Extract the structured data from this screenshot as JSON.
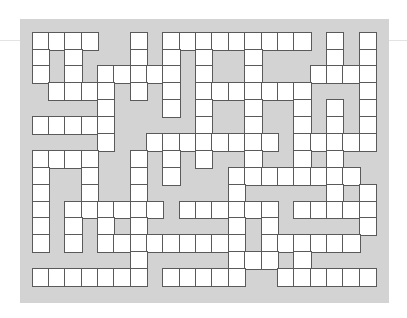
{
  "puzzle": {
    "type": "crossword-grid",
    "columns": 21,
    "rows": 15,
    "colors": {
      "background": "#ffffff",
      "frame": "#d3d3d3",
      "white_cell": "#ffffff",
      "grid_line": "#5a5a5a"
    },
    "grid": [
      [
        1,
        1,
        1,
        1,
        0,
        0,
        1,
        0,
        1,
        1,
        1,
        1,
        1,
        1,
        1,
        1,
        1,
        0,
        1,
        0,
        1
      ],
      [
        1,
        0,
        1,
        0,
        0,
        0,
        1,
        0,
        1,
        0,
        1,
        0,
        0,
        1,
        0,
        0,
        0,
        0,
        1,
        0,
        1
      ],
      [
        1,
        0,
        1,
        0,
        1,
        1,
        1,
        1,
        1,
        0,
        1,
        0,
        0,
        1,
        0,
        0,
        0,
        1,
        1,
        1,
        1
      ],
      [
        0,
        1,
        1,
        1,
        1,
        0,
        1,
        0,
        1,
        0,
        1,
        1,
        1,
        1,
        1,
        1,
        1,
        0,
        0,
        0,
        1
      ],
      [
        0,
        0,
        0,
        0,
        1,
        0,
        0,
        0,
        1,
        0,
        1,
        0,
        0,
        1,
        0,
        0,
        1,
        0,
        1,
        0,
        1
      ],
      [
        1,
        1,
        1,
        1,
        1,
        0,
        0,
        0,
        0,
        0,
        1,
        0,
        0,
        1,
        0,
        0,
        1,
        0,
        1,
        0,
        1
      ],
      [
        0,
        0,
        0,
        0,
        1,
        0,
        0,
        1,
        1,
        1,
        1,
        1,
        1,
        1,
        1,
        0,
        1,
        1,
        1,
        1,
        1
      ],
      [
        1,
        1,
        1,
        1,
        0,
        0,
        1,
        0,
        1,
        0,
        1,
        0,
        0,
        1,
        0,
        0,
        1,
        0,
        1,
        0,
        0
      ],
      [
        1,
        0,
        0,
        1,
        0,
        0,
        1,
        0,
        1,
        0,
        0,
        0,
        1,
        1,
        1,
        1,
        1,
        1,
        1,
        1,
        0
      ],
      [
        1,
        0,
        0,
        1,
        0,
        0,
        1,
        0,
        0,
        0,
        0,
        0,
        1,
        0,
        0,
        0,
        0,
        0,
        1,
        0,
        1
      ],
      [
        1,
        0,
        1,
        1,
        1,
        1,
        1,
        1,
        0,
        1,
        1,
        1,
        1,
        1,
        1,
        0,
        1,
        1,
        1,
        1,
        1
      ],
      [
        1,
        0,
        1,
        0,
        1,
        0,
        1,
        0,
        0,
        0,
        0,
        0,
        1,
        0,
        1,
        0,
        0,
        0,
        0,
        0,
        1
      ],
      [
        1,
        0,
        1,
        0,
        1,
        1,
        1,
        1,
        1,
        1,
        1,
        1,
        1,
        0,
        1,
        1,
        1,
        1,
        1,
        1,
        0
      ],
      [
        0,
        0,
        0,
        0,
        0,
        0,
        1,
        0,
        0,
        0,
        0,
        0,
        1,
        1,
        1,
        0,
        1,
        0,
        0,
        0,
        0
      ],
      [
        1,
        1,
        1,
        1,
        1,
        1,
        1,
        0,
        1,
        1,
        1,
        1,
        1,
        0,
        0,
        1,
        1,
        1,
        1,
        1,
        1
      ]
    ]
  }
}
